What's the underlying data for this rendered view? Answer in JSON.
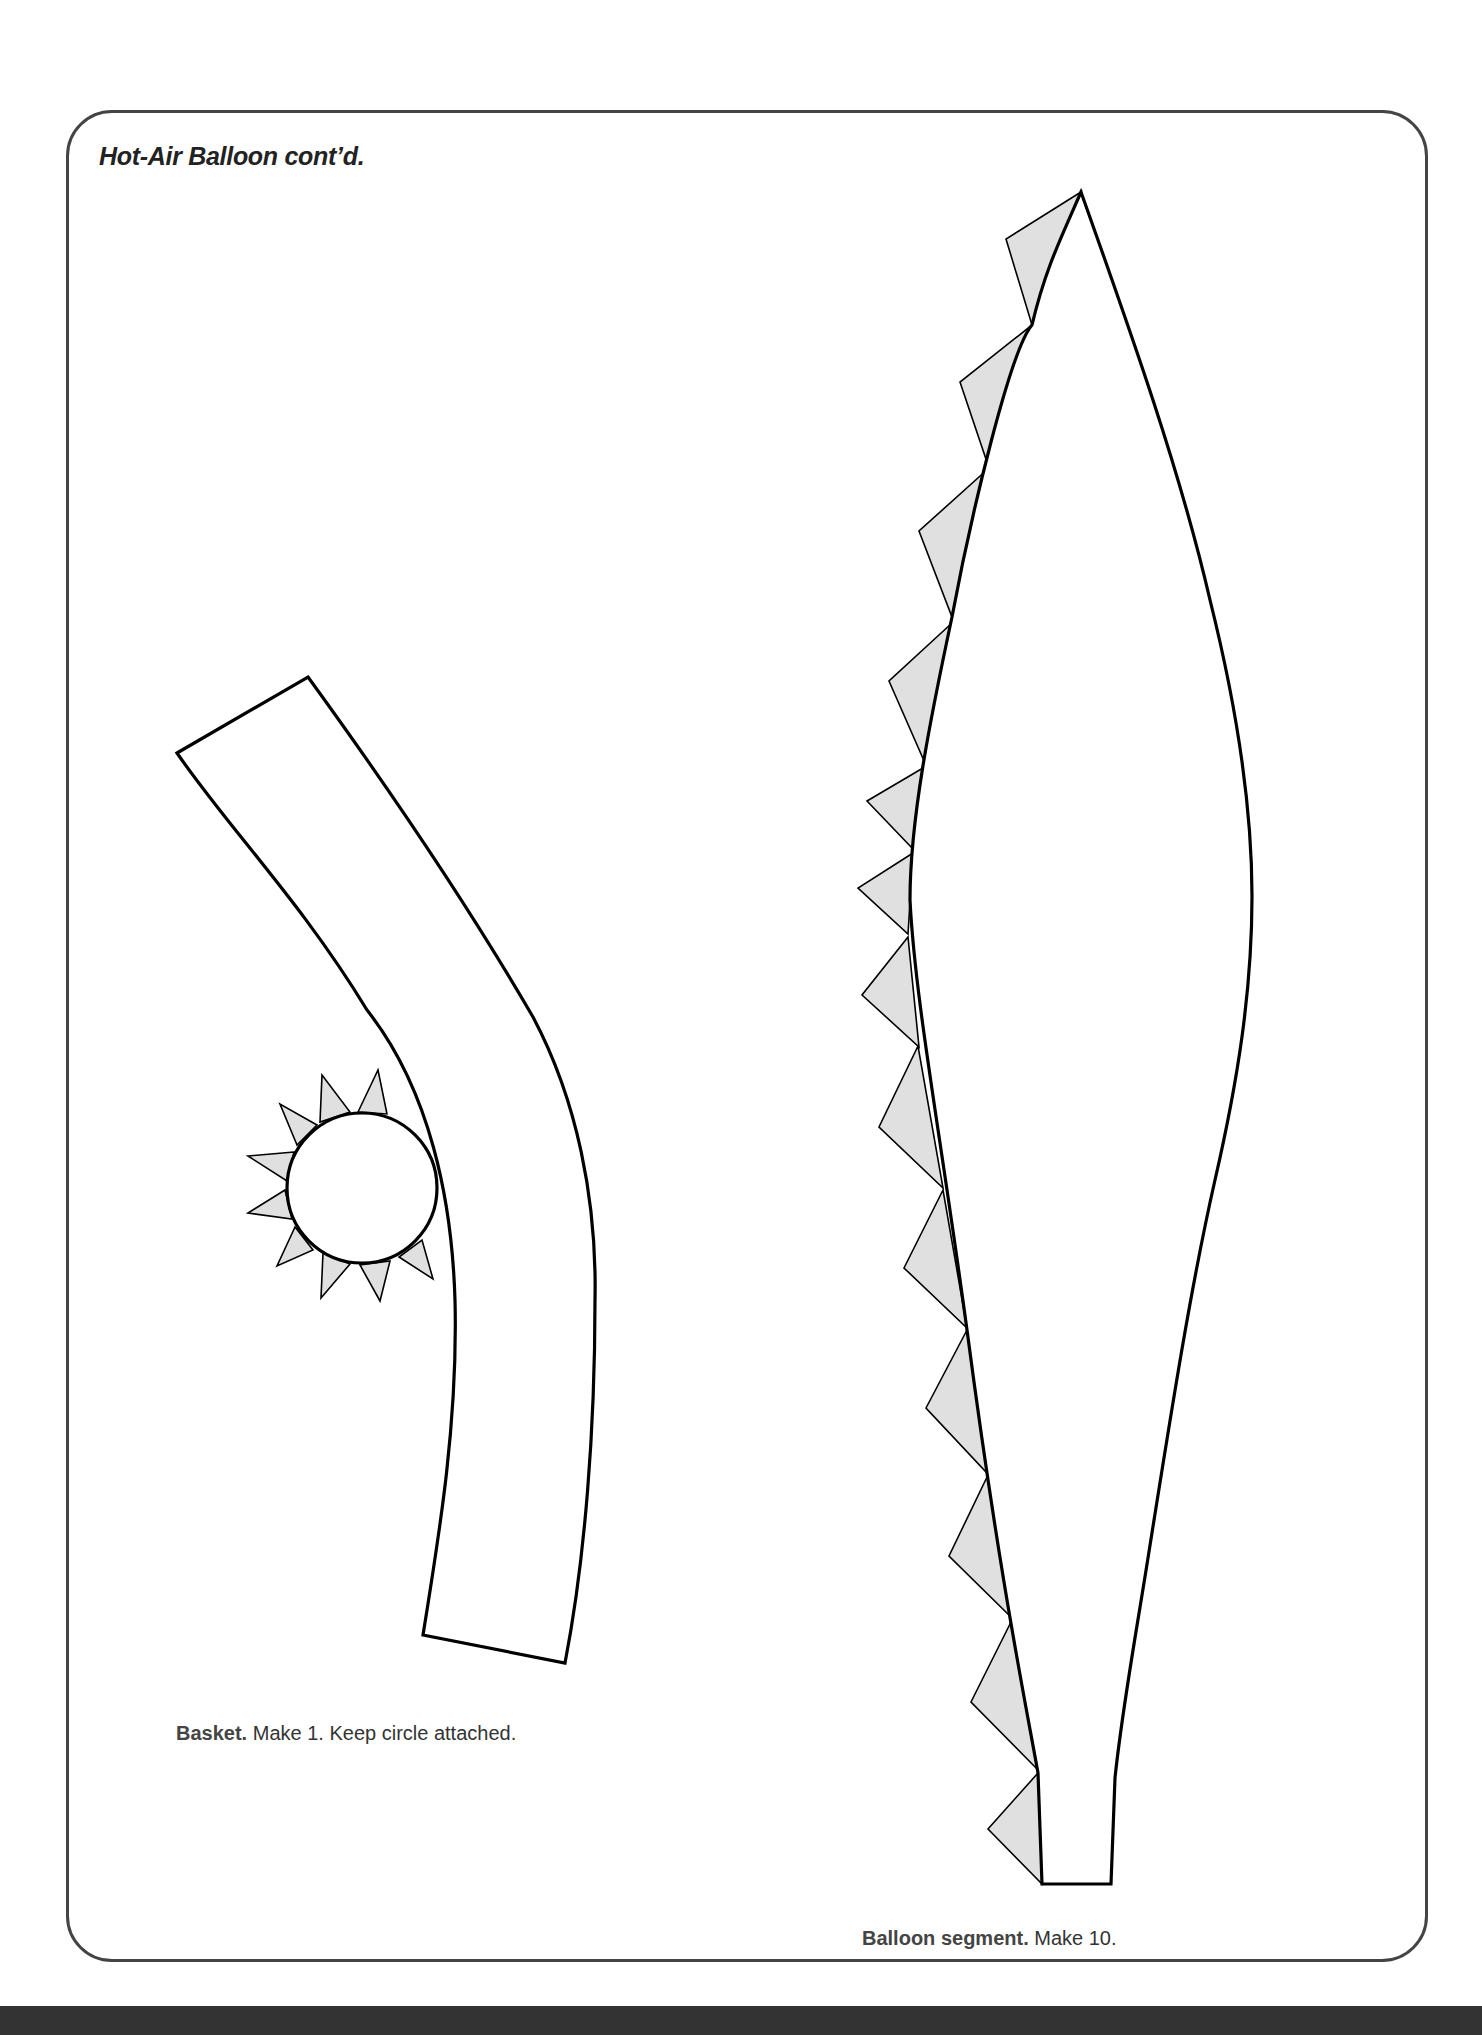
{
  "page": {
    "title": "Hot-Air Balloon cont’d."
  },
  "pieces": {
    "basket": {
      "name_label": "Basket.",
      "instructions": "Make 1. Keep circle attached.",
      "tab_fill": "#e0e0e0",
      "outline_color": "#000000"
    },
    "balloon_segment": {
      "name_label": "Balloon segment.",
      "instructions": "Make 10.",
      "tab_fill": "#e0e0e0",
      "outline_color": "#000000"
    }
  },
  "colors": {
    "frame_border": "#444444",
    "background": "#ffffff",
    "bottom_band": "#333333"
  }
}
